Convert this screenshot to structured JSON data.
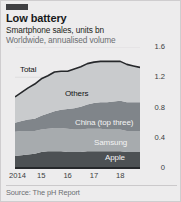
{
  "card": {
    "accent_color": "#3f3f42",
    "background_color": "#edeced",
    "title": "Low battery",
    "subtitle_primary": "Smartphone sales, units bn",
    "subtitle_secondary": "Worldwide, annualised volume",
    "source": "Source: The pH Report"
  },
  "chart_data": {
    "type": "area",
    "title": "Low battery",
    "subtitle": "Smartphone sales, units bn",
    "note": "Worldwide, annualised volume",
    "xlabel": "",
    "ylabel": "units bn",
    "ylim": [
      0,
      1.6
    ],
    "yticks": [
      0,
      0.4,
      0.8,
      1.2,
      1.6
    ],
    "ytick_labels": [
      "0",
      "0.4",
      "0.8",
      "1.2",
      "1.6"
    ],
    "xticks": [
      2014,
      2015,
      2016,
      2017,
      2018
    ],
    "xtick_labels": [
      "2014",
      "15",
      "16",
      "17",
      "18"
    ],
    "grid": true,
    "legend": "inline-labels",
    "stacked": true,
    "x": [
      2014.0,
      2014.25,
      2014.5,
      2014.75,
      2015.0,
      2015.25,
      2015.5,
      2015.75,
      2016.0,
      2016.25,
      2016.5,
      2016.75,
      2017.0,
      2017.25,
      2017.5,
      2017.75,
      2018.0,
      2018.25,
      2018.5,
      2018.75
    ],
    "series": [
      {
        "name": "Apple",
        "color": "#4d5154",
        "label_color": "#f4f4f4",
        "values": [
          0.16,
          0.17,
          0.18,
          0.19,
          0.21,
          0.22,
          0.22,
          0.22,
          0.21,
          0.21,
          0.21,
          0.22,
          0.22,
          0.22,
          0.22,
          0.22,
          0.22,
          0.21,
          0.21,
          0.21
        ]
      },
      {
        "name": "Samsung",
        "color": "#a7abae",
        "label_color": "#f4f4f4",
        "values": [
          0.32,
          0.32,
          0.31,
          0.3,
          0.3,
          0.3,
          0.31,
          0.31,
          0.31,
          0.3,
          0.3,
          0.3,
          0.3,
          0.3,
          0.29,
          0.29,
          0.29,
          0.28,
          0.28,
          0.28
        ]
      },
      {
        "name": "China (top three)",
        "color": "#80858a",
        "label_color": "#f4f4f4",
        "values": [
          0.12,
          0.13,
          0.15,
          0.16,
          0.18,
          0.2,
          0.22,
          0.24,
          0.26,
          0.28,
          0.3,
          0.32,
          0.34,
          0.35,
          0.36,
          0.37,
          0.38,
          0.38,
          0.38,
          0.38
        ]
      },
      {
        "name": "Others",
        "color": "#c9cbcd",
        "label_color": "#111214",
        "values": [
          0.34,
          0.38,
          0.42,
          0.46,
          0.49,
          0.5,
          0.52,
          0.51,
          0.5,
          0.52,
          0.53,
          0.54,
          0.54,
          0.54,
          0.54,
          0.53,
          0.52,
          0.5,
          0.48,
          0.46
        ]
      }
    ],
    "total": {
      "name": "Total",
      "color": "#26282b",
      "label_color": "#111214",
      "values": [
        0.94,
        1.0,
        1.06,
        1.11,
        1.18,
        1.22,
        1.27,
        1.28,
        1.28,
        1.31,
        1.34,
        1.38,
        1.4,
        1.41,
        1.41,
        1.41,
        1.41,
        1.37,
        1.35,
        1.33
      ]
    }
  }
}
